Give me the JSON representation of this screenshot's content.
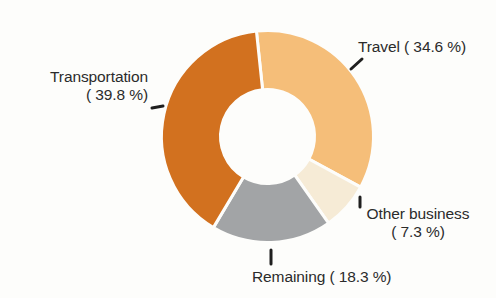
{
  "chart_data": {
    "type": "pie",
    "variant": "donut",
    "title": "",
    "subtitle": "",
    "xlabel": "",
    "ylabel": "",
    "grid": false,
    "legend_position": "callout-labels",
    "units": "%",
    "start_angle_deg": -6,
    "direction": "clockwise",
    "categories": [
      "Travel",
      "Other business",
      "Remaining",
      "Transportation"
    ],
    "values": [
      34.6,
      7.3,
      18.3,
      39.8
    ],
    "colors": [
      "#F5BE79",
      "#F6EBD6",
      "#A2A4A6",
      "#D2711F"
    ],
    "slices": [
      {
        "label": "Travel",
        "value": 34.6,
        "display": "Travel ( 34.6 %)",
        "color": "#F5BE79"
      },
      {
        "label": "Other business",
        "value": 7.3,
        "display": "Other business ( 7.3 %)",
        "color": "#F6EBD6"
      },
      {
        "label": "Remaining",
        "value": 18.3,
        "display": "Remaining ( 18.3 %)",
        "color": "#A2A4A6"
      },
      {
        "label": "Transportation",
        "value": 39.8,
        "display": "Transportation ( 39.8 %)",
        "color": "#D2711F"
      }
    ]
  },
  "labels": {
    "travel": {
      "text": "Travel ( 34.6 %)"
    },
    "transportation": {
      "name": "Transportation",
      "percent": "( 39.8 %)"
    },
    "other_business": {
      "name": "Other business",
      "percent": "( 7.3 %)"
    },
    "remaining": {
      "text": "Remaining ( 18.3 %)"
    }
  },
  "colors": {
    "travel": "#F5BE79",
    "other_business": "#F6EBD6",
    "remaining": "#A2A4A6",
    "transportation": "#D2711F",
    "background": "#fdfdfb",
    "text": "#2b2b2b",
    "leader": "#1f1f1f"
  }
}
